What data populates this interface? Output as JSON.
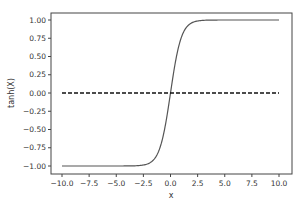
{
  "chart_data": {
    "type": "line",
    "title": "",
    "xlabel": "x",
    "ylabel": "tanh(X)",
    "xlim": [
      -11,
      11
    ],
    "ylim": [
      -1.1,
      1.1
    ],
    "grid": false,
    "legend": null,
    "x_ticks": [
      -10.0,
      -7.5,
      -5.0,
      -2.5,
      0.0,
      2.5,
      5.0,
      7.5,
      10.0
    ],
    "x_tick_labels": [
      "−10.0",
      "−7.5",
      "−5.0",
      "−2.5",
      "0.0",
      "2.5",
      "5.0",
      "7.5",
      "10.0"
    ],
    "y_ticks": [
      1.0,
      0.75,
      0.5,
      0.25,
      0.0,
      -0.25,
      -0.5,
      -0.75,
      -1.0
    ],
    "y_tick_labels": [
      "1.00",
      "0.75",
      "0.50",
      "0.25",
      "0.00",
      "−0.25",
      "−0.50",
      "−0.75",
      "−1.00"
    ],
    "series": [
      {
        "name": "tanh(x)",
        "function": "tanh",
        "x_range": [
          -10,
          10
        ],
        "x": [
          -10,
          -7.5,
          -5,
          -3,
          -2.5,
          -2,
          -1.5,
          -1,
          -0.5,
          0,
          0.5,
          1,
          1.5,
          2,
          2.5,
          3,
          5,
          7.5,
          10
        ],
        "values": [
          -1.0,
          -1.0,
          -0.9999,
          -0.995,
          -0.987,
          -0.964,
          -0.905,
          -0.762,
          -0.462,
          0.0,
          0.462,
          0.762,
          0.905,
          0.964,
          0.987,
          0.995,
          0.9999,
          1.0,
          1.0
        ],
        "color": "#555555",
        "style": "solid"
      },
      {
        "name": "y=0",
        "x": [
          -10,
          10
        ],
        "values": [
          0,
          0
        ],
        "color": "#111111",
        "style": "dashed"
      }
    ]
  }
}
